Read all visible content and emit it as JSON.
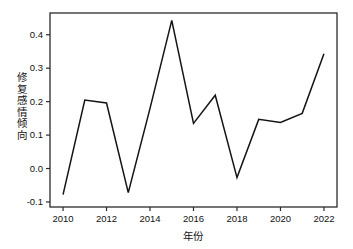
{
  "chart_data": {
    "type": "line",
    "title": "",
    "xlabel": "年份",
    "ylabel": "修复感情倾向",
    "x": [
      2010,
      2011,
      2012,
      2013,
      2014,
      2015,
      2016,
      2017,
      2018,
      2019,
      2020,
      2021,
      2022
    ],
    "values": [
      -0.078,
      0.205,
      0.196,
      -0.072,
      0.18,
      0.443,
      0.135,
      0.219,
      -0.027,
      0.147,
      0.138,
      0.165,
      0.343
    ],
    "series": [
      {
        "name": "修复感情倾向",
        "values": [
          -0.078,
          0.205,
          0.196,
          -0.072,
          0.18,
          0.443,
          0.135,
          0.219,
          -0.027,
          0.147,
          0.138,
          0.165,
          0.343
        ]
      }
    ],
    "xlim": [
      2009.4,
      2022.6
    ],
    "ylim": [
      -0.115,
      0.465
    ],
    "xticks": [
      2010,
      2012,
      2014,
      2016,
      2018,
      2020,
      2022
    ],
    "xtick_labels": [
      "2010",
      "2012",
      "2014",
      "2016",
      "2018",
      "2020",
      "2022"
    ],
    "yticks": [
      -0.1,
      0.0,
      0.1,
      0.2,
      0.3,
      0.4
    ],
    "ytick_labels": [
      "-0.1",
      "0.0",
      "0.1",
      "0.2",
      "0.3",
      "0.4"
    ],
    "grid": false,
    "legend": "none",
    "line_color": "#141414",
    "axis_color": "#2b2b2b",
    "background_color": "#ffffff"
  },
  "plot": {
    "left": 50,
    "right": 337,
    "top": 13,
    "bottom": 207
  }
}
